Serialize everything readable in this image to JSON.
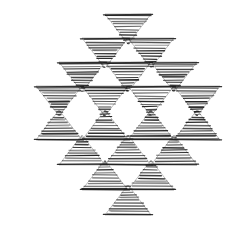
{
  "artwork": {
    "title": "Inverted triangle lattice",
    "medium": "hand-drawn horizontal hatching",
    "background_color": "#ffffff",
    "ink_color": "#1a1a1a",
    "canvas": {
      "width": 231,
      "height": 226
    },
    "overall_shape": "diamond / rhombus lattice",
    "row_counts": [
      1,
      2,
      3,
      4,
      4,
      3,
      2,
      1
    ],
    "triangle_total": 20,
    "triangle_width": 46,
    "triangle_height": 30,
    "row_pitch": 25,
    "column_pitch": 46,
    "hatch_line_count": 11,
    "hatch_line_color": "#222222"
  },
  "rows": [
    {
      "index": 1,
      "orientation": "down",
      "count": 1,
      "y_top": 14,
      "triangles": [
        {
          "id": "r1c1",
          "cx": 128,
          "y_top": 14,
          "orientation": "down",
          "width": 46,
          "height": 30,
          "seed": 3
        }
      ]
    },
    {
      "index": 2,
      "orientation": "down",
      "count": 2,
      "y_top": 38,
      "triangles": [
        {
          "id": "r2c1",
          "cx": 105,
          "y_top": 38,
          "orientation": "down",
          "width": 46,
          "height": 30,
          "seed": 11
        },
        {
          "id": "r2c2",
          "cx": 151,
          "y_top": 38,
          "orientation": "down",
          "width": 46,
          "height": 30,
          "seed": 19
        }
      ]
    },
    {
      "index": 3,
      "orientation": "down",
      "count": 3,
      "y_top": 62,
      "triangles": [
        {
          "id": "r3c1",
          "cx": 82,
          "y_top": 62,
          "orientation": "down",
          "width": 46,
          "height": 30,
          "seed": 27
        },
        {
          "id": "r3c2",
          "cx": 128,
          "y_top": 62,
          "orientation": "down",
          "width": 46,
          "height": 30,
          "seed": 35
        },
        {
          "id": "r3c3",
          "cx": 174,
          "y_top": 62,
          "orientation": "down",
          "width": 46,
          "height": 30,
          "seed": 43
        }
      ]
    },
    {
      "index": 4,
      "orientation": "down",
      "count": 4,
      "y_top": 86,
      "triangles": [
        {
          "id": "r4c1",
          "cx": 59,
          "y_top": 86,
          "orientation": "down",
          "width": 46,
          "height": 30,
          "seed": 51
        },
        {
          "id": "r4c2",
          "cx": 105,
          "y_top": 86,
          "orientation": "down",
          "width": 46,
          "height": 30,
          "seed": 59
        },
        {
          "id": "r4c3",
          "cx": 151,
          "y_top": 86,
          "orientation": "down",
          "width": 46,
          "height": 30,
          "seed": 67
        },
        {
          "id": "r4c4",
          "cx": 197,
          "y_top": 86,
          "orientation": "down",
          "width": 46,
          "height": 30,
          "seed": 75
        }
      ]
    },
    {
      "index": 5,
      "orientation": "up",
      "count": 4,
      "y_top": 110,
      "triangles": [
        {
          "id": "r5c1",
          "cx": 59,
          "y_top": 110,
          "orientation": "up",
          "width": 46,
          "height": 30,
          "seed": 83
        },
        {
          "id": "r5c2",
          "cx": 105,
          "y_top": 110,
          "orientation": "up",
          "width": 46,
          "height": 30,
          "seed": 91
        },
        {
          "id": "r5c3",
          "cx": 151,
          "y_top": 110,
          "orientation": "up",
          "width": 46,
          "height": 30,
          "seed": 99
        },
        {
          "id": "r5c4",
          "cx": 197,
          "y_top": 110,
          "orientation": "up",
          "width": 46,
          "height": 30,
          "seed": 107
        }
      ]
    },
    {
      "index": 6,
      "orientation": "up",
      "count": 3,
      "y_top": 135,
      "triangles": [
        {
          "id": "r6c1",
          "cx": 82,
          "y_top": 135,
          "orientation": "up",
          "width": 46,
          "height": 30,
          "seed": 115
        },
        {
          "id": "r6c2",
          "cx": 128,
          "y_top": 135,
          "orientation": "up",
          "width": 46,
          "height": 30,
          "seed": 123
        },
        {
          "id": "r6c3",
          "cx": 174,
          "y_top": 135,
          "orientation": "up",
          "width": 46,
          "height": 30,
          "seed": 131
        }
      ]
    },
    {
      "index": 7,
      "orientation": "up",
      "count": 2,
      "y_top": 160,
      "triangles": [
        {
          "id": "r7c1",
          "cx": 105,
          "y_top": 160,
          "orientation": "up",
          "width": 46,
          "height": 30,
          "seed": 139
        },
        {
          "id": "r7c2",
          "cx": 151,
          "y_top": 160,
          "orientation": "up",
          "width": 46,
          "height": 30,
          "seed": 147
        }
      ]
    },
    {
      "index": 8,
      "orientation": "up",
      "count": 1,
      "y_top": 185,
      "triangles": [
        {
          "id": "r8c1",
          "cx": 128,
          "y_top": 185,
          "orientation": "up",
          "width": 46,
          "height": 30,
          "seed": 155
        }
      ]
    }
  ]
}
